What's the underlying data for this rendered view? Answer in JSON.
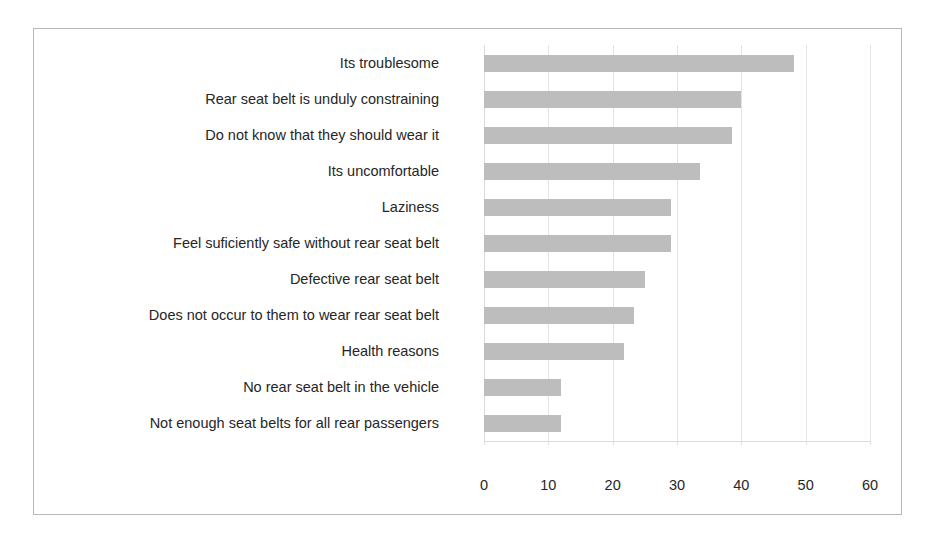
{
  "chart_data": {
    "type": "bar",
    "orientation": "horizontal",
    "title": "",
    "subtitle": "",
    "xlabel": "",
    "ylabel": "",
    "xlim": [
      0,
      60
    ],
    "xticks": [
      "0",
      "10",
      "20",
      "30",
      "40",
      "50",
      "60"
    ],
    "xtick_values": [
      0,
      10,
      20,
      30,
      40,
      50,
      60
    ],
    "grid": "vertical",
    "legend": "none",
    "bar_color": "#bdbdbd",
    "frame_color": "#b9b9b9",
    "gridline_color": "#e4e4e4",
    "text_color": "#262626",
    "categories": [
      "Its troublesome",
      "Rear seat belt is unduly constraining",
      "Do not know that they should wear it",
      "Its uncomfortable",
      "Laziness",
      "Feel suficiently safe without rear seat belt",
      "Defective rear seat belt",
      "Does not occur to them to wear rear seat belt",
      "Health reasons",
      "No rear seat belt in the vehicle",
      "Not enough seat belts for all rear passengers"
    ],
    "values": [
      48.2,
      40.0,
      38.5,
      33.5,
      29.0,
      29.0,
      25.0,
      23.3,
      21.8,
      12.0,
      12.0
    ]
  }
}
